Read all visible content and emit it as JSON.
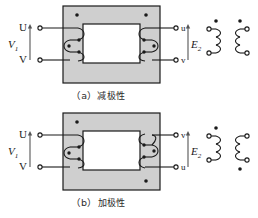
{
  "figure": {
    "colors": {
      "core_fill": "#cfcfcf",
      "window_fill": "#ffffff",
      "line": "#1a1a1a",
      "background": "#ffffff",
      "text": "#2b2b2b"
    }
  },
  "panels": [
    {
      "id": "a",
      "caption_index": "（a）",
      "caption_text": "减极性",
      "caption_full": "（a）减极性",
      "primary_label": "V",
      "primary_sub": "1",
      "secondary_label": "E",
      "secondary_sub": "2",
      "terminals": {
        "primary_top": "U",
        "primary_bottom": "V",
        "secondary_top": "u",
        "secondary_bottom": "v"
      },
      "core_dots": [
        "top-left",
        "top-right"
      ],
      "schematic_dots": [
        "left-top",
        "right-top"
      ],
      "arrow_primary": "up",
      "arrow_secondary": "up"
    },
    {
      "id": "b",
      "caption_index": "（b）",
      "caption_text": "加极性",
      "caption_full": "（b）加极性",
      "primary_label": "V",
      "primary_sub": "1",
      "secondary_label": "E",
      "secondary_sub": "2",
      "terminals": {
        "primary_top": "U",
        "primary_bottom": "V",
        "secondary_top": "v",
        "secondary_bottom": "u"
      },
      "core_dots": [
        "top-left",
        "bottom-right"
      ],
      "schematic_dots": [
        "left-top",
        "right-bottom"
      ],
      "arrow_primary": "up",
      "arrow_secondary": "up"
    }
  ]
}
